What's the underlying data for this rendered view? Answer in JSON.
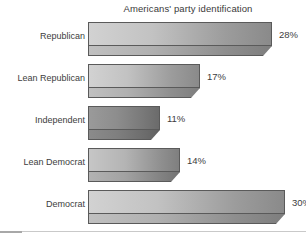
{
  "chart_data": {
    "type": "bar",
    "orientation": "horizontal",
    "title": "Americans' party identification",
    "xlabel": "",
    "ylabel": "",
    "categories": [
      "Republican",
      "Lean Republican",
      "Independent",
      "Lean Democrat",
      "Democrat"
    ],
    "values": [
      28,
      17,
      11,
      14,
      30
    ],
    "value_labels": [
      "28%",
      "17%",
      "11%",
      "14%",
      "30%"
    ],
    "unit": "%",
    "xlim": [
      0,
      30
    ],
    "grid": false,
    "legend": null,
    "style_3d": true,
    "bar_shades": [
      "light",
      "light",
      "dark",
      "mid",
      "light"
    ]
  },
  "colors": {
    "background": "#ffffff",
    "text": "#3d3d3d",
    "title_text": "#3a3a3a",
    "bar_outline": "#5a5a5a",
    "bar_light_start": "#d2d2d2",
    "bar_light_end": "#8a8a8a",
    "bar_mid_start": "#c6c6c6",
    "bar_mid_end": "#7f7f7f",
    "bar_dark_start": "#9a9a9a",
    "bar_dark_end": "#6b6b6b",
    "bottom_rule": "#c9c9c9"
  }
}
